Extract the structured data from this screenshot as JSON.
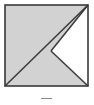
{
  "figure": {
    "canvas": {
      "width": 94,
      "height": 105
    },
    "colors": {
      "fill_gray": "#d2d2d2",
      "fill_white": "#ffffff",
      "stroke": "#3a3a3a",
      "background": "#ffffff",
      "caption_mark": "#8a8a8a"
    },
    "square": {
      "name": "outer-square",
      "left": 5,
      "top": 5,
      "right": 88,
      "bottom": 86,
      "stroke_width": 1.6
    },
    "center_vertex": {
      "x": 51,
      "y": 51
    },
    "shaded_region": {
      "name": "shaded-arrowhead",
      "description": "Square minus the white triangle on the right side",
      "points": "5,5 88,5 51,51 88,86 5,86"
    },
    "white_notch": {
      "name": "white-triangle-notch",
      "description": "Triangle with apex at center pointing left, base on right edge",
      "points": "51,51 88,5 88,86"
    },
    "diagonals": [
      {
        "name": "diagonal-top-right",
        "from": {
          "x": 88,
          "y": 5
        },
        "to": {
          "x": 51,
          "y": 51
        }
      },
      {
        "name": "diagonal-bottom-right",
        "from": {
          "x": 51,
          "y": 51
        },
        "to": {
          "x": 88,
          "y": 86
        }
      },
      {
        "name": "diagonal-main",
        "from": {
          "x": 5,
          "y": 86
        },
        "to": {
          "x": 88,
          "y": 5
        }
      }
    ],
    "caption": {
      "mark_label": "caption-rule",
      "text": ""
    }
  }
}
